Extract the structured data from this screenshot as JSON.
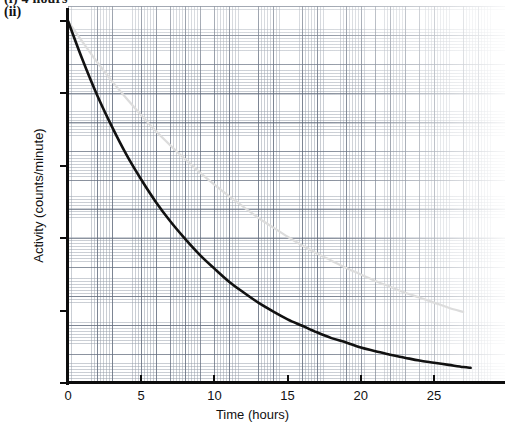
{
  "header": {
    "question_text": "(i) 4 hours",
    "part_label": "(ii)"
  },
  "chart_data": {
    "type": "line",
    "title": "",
    "xlabel": "Time (hours)",
    "ylabel": "Activity (counts/minute)",
    "xlim": [
      0,
      29.8
    ],
    "ylim": [
      0,
      517
    ],
    "xticks": [
      0,
      5,
      10,
      15,
      20,
      25
    ],
    "xtick_labels": [
      "0",
      "5",
      "10",
      "15",
      "20",
      "25"
    ],
    "yticks": [
      0,
      100,
      200,
      300,
      400,
      500
    ],
    "ytick_labels": [
      "0",
      "100",
      "200",
      "300",
      "400",
      "500"
    ],
    "grid": true,
    "grid_style": "graph-paper",
    "minor_grid_step_x": 0.2,
    "minor_grid_step_y": 4,
    "major_grid_step_x": 1,
    "major_grid_step_y": 20,
    "legend": "none",
    "series": [
      {
        "name": "measured-decay-curve",
        "color": "#111111",
        "width": 2.6,
        "half_life_hours": 6.0,
        "initial_activity": 500,
        "x": [
          0,
          1,
          2,
          3,
          4,
          5,
          6,
          7,
          8,
          9,
          10,
          11,
          12,
          13,
          14,
          15,
          16,
          17,
          18,
          19,
          20,
          21,
          22,
          23,
          24,
          25,
          26,
          27,
          27.5
        ],
        "y": [
          500,
          446,
          397,
          354,
          315,
          281,
          250,
          223,
          199,
          177,
          158,
          140,
          125,
          111,
          99,
          88,
          79,
          70,
          62,
          56,
          49,
          44,
          39,
          35,
          31,
          28,
          25,
          22,
          21
        ]
      },
      {
        "name": "comparison-decay-curve",
        "color": "#dcdcdc",
        "width": 2.2,
        "half_life_hours": 11.5,
        "initial_activity": 500,
        "x": [
          0,
          1,
          2,
          3,
          4,
          5,
          6,
          7,
          8,
          9,
          10,
          11,
          12,
          13,
          14,
          15,
          16,
          17,
          18,
          19,
          20,
          21,
          22,
          23,
          24,
          25,
          26,
          27
        ],
        "y": [
          500,
          471,
          443,
          417,
          393,
          370,
          348,
          328,
          309,
          291,
          274,
          258,
          243,
          228,
          215,
          202,
          190,
          179,
          169,
          159,
          150,
          141,
          133,
          125,
          118,
          111,
          104,
          98
        ]
      }
    ]
  }
}
